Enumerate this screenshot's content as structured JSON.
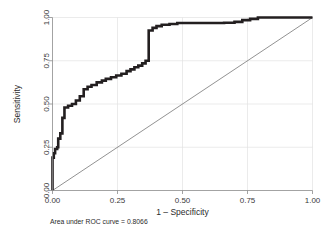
{
  "chart_data": {
    "type": "line",
    "title": "",
    "xlabel": "1 – Specificity",
    "ylabel": "Sensitivity",
    "xlim": [
      0.0,
      1.0
    ],
    "ylim": [
      0.0,
      1.0
    ],
    "grid": true,
    "legend": "none",
    "annotation": "Area under ROC curve = 0.8066",
    "auc": 0.8066,
    "xticks": [
      "0.00",
      "0.25",
      "0.50",
      "0.75",
      "1.00"
    ],
    "xtick_values": [
      0.0,
      0.25,
      0.5,
      0.75,
      1.0
    ],
    "yticks": [
      "0.00",
      "0.25",
      "0.50",
      "0.75",
      "1.00"
    ],
    "ytick_values": [
      0.0,
      0.25,
      0.5,
      0.75,
      1.0
    ],
    "series": [
      {
        "name": "ROC curve",
        "color": "#231f20",
        "style": "step",
        "x": [
          0.0,
          0.0,
          0.005,
          0.005,
          0.01,
          0.01,
          0.018,
          0.018,
          0.022,
          0.022,
          0.03,
          0.03,
          0.038,
          0.038,
          0.046,
          0.046,
          0.06,
          0.06,
          0.075,
          0.075,
          0.09,
          0.09,
          0.105,
          0.105,
          0.12,
          0.12,
          0.135,
          0.135,
          0.15,
          0.15,
          0.17,
          0.17,
          0.19,
          0.19,
          0.205,
          0.205,
          0.225,
          0.225,
          0.245,
          0.245,
          0.265,
          0.265,
          0.285,
          0.285,
          0.3,
          0.3,
          0.315,
          0.315,
          0.33,
          0.33,
          0.345,
          0.345,
          0.358,
          0.358,
          0.37,
          0.37,
          0.385,
          0.385,
          0.4,
          0.4,
          0.42,
          0.42,
          0.45,
          0.45,
          0.48,
          0.48,
          0.53,
          0.53,
          0.6,
          0.6,
          0.66,
          0.66,
          0.7,
          0.7,
          0.73,
          0.73,
          0.76,
          0.76,
          0.79,
          0.79,
          0.85,
          1.0
        ],
        "y": [
          0.0,
          0.19,
          0.19,
          0.215,
          0.215,
          0.24,
          0.24,
          0.25,
          0.25,
          0.3,
          0.3,
          0.33,
          0.33,
          0.42,
          0.42,
          0.48,
          0.48,
          0.49,
          0.49,
          0.5,
          0.5,
          0.52,
          0.52,
          0.545,
          0.545,
          0.585,
          0.585,
          0.6,
          0.6,
          0.61,
          0.61,
          0.625,
          0.625,
          0.635,
          0.635,
          0.645,
          0.645,
          0.655,
          0.655,
          0.665,
          0.665,
          0.675,
          0.675,
          0.69,
          0.69,
          0.7,
          0.7,
          0.712,
          0.712,
          0.722,
          0.722,
          0.735,
          0.735,
          0.75,
          0.75,
          0.925,
          0.925,
          0.94,
          0.94,
          0.95,
          0.95,
          0.958,
          0.958,
          0.962,
          0.962,
          0.968,
          0.968,
          0.968,
          0.968,
          0.968,
          0.968,
          0.97,
          0.97,
          0.975,
          0.975,
          0.985,
          0.985,
          0.992,
          0.992,
          1.0,
          1.0,
          1.0
        ]
      },
      {
        "name": "Reference diagonal",
        "color": "#6e6e6e",
        "style": "line",
        "x": [
          0.0,
          1.0
        ],
        "y": [
          0.0,
          1.0
        ]
      }
    ]
  },
  "figure": {
    "caption": "Area under ROC curve = 0.8066",
    "x_axis_title": "1 – Specificity",
    "y_axis_title": "Sensitivity",
    "x_tick_labels": [
      "0.00",
      "0.25",
      "0.50",
      "0.75",
      "1.00"
    ],
    "y_tick_labels": [
      "0.00",
      "0.25",
      "0.50",
      "0.75",
      "1.00"
    ],
    "colors": {
      "background": "#ffffff",
      "curve": "#231f20",
      "reference": "#6e6e6e",
      "grid": "#e3e3e3",
      "axis": "#8c8c8c",
      "text": "#2b2b2b"
    }
  }
}
